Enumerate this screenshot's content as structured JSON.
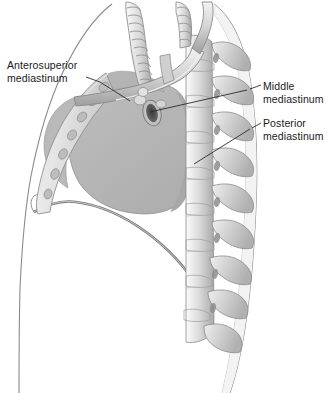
{
  "figure": {
    "background_color": "#ffffff",
    "width": 331,
    "height": 393
  },
  "labels": [
    {
      "id": "anterosuperior",
      "name": "anterosuperior-mediastinum-label",
      "line1": "Anterosuperior",
      "line2": "mediastinum",
      "side": "left",
      "leader_from": [
        88,
        77
      ],
      "leader_to": [
        128,
        100
      ]
    },
    {
      "id": "middle",
      "name": "middle-mediastinum-label",
      "line1": "Middle",
      "line2": "mediastinum",
      "side": "right",
      "leader_from": [
        260,
        84
      ],
      "leader_to": [
        150,
        110
      ]
    },
    {
      "id": "posterior",
      "name": "posterior-mediastinum-label",
      "line1": "Posterior",
      "line2": "mediastinum",
      "side": "right",
      "leader_from": [
        260,
        122
      ],
      "leader_to": [
        196,
        163
      ]
    }
  ],
  "structures": [
    {
      "name": "trachea",
      "description": "ringed cartilaginous airway descending from superior thorax"
    },
    {
      "name": "aortic-arch",
      "description": "great vessel arching over the left main bronchus"
    },
    {
      "name": "bronchus-cross-section",
      "description": "dark oval lumen at the hilum"
    },
    {
      "name": "thoracic-vertebral-column",
      "description": "stacked vertebral bodies with spinous and transverse processes"
    },
    {
      "name": "sternum",
      "description": "anterior chest wall bone with costal cartilage articulations"
    },
    {
      "name": "costal-cartilages",
      "description": "oval joints along the sternal border"
    },
    {
      "name": "diaphragm",
      "description": "dome-shaped muscular floor of the thoracic cavity"
    },
    {
      "name": "mediastinum-shading",
      "description": "gray shaded mediastinal mass between sternum and spine"
    },
    {
      "name": "body-wall-outline",
      "description": "anterior and posterior torso contour"
    }
  ],
  "colors": {
    "outline": "#6e6e6e",
    "label_text": "#1a1a1a",
    "leader_line": "#2b2b2b",
    "mediastinum_fill": "#b6b6b6",
    "bone_light": "#e8e8e8",
    "bone_mid": "#cfcfcf",
    "bone_shadow": "#9a9a9a",
    "soft_tissue": "#f1f1f1",
    "lumen_dark": "#4a4a4a"
  }
}
